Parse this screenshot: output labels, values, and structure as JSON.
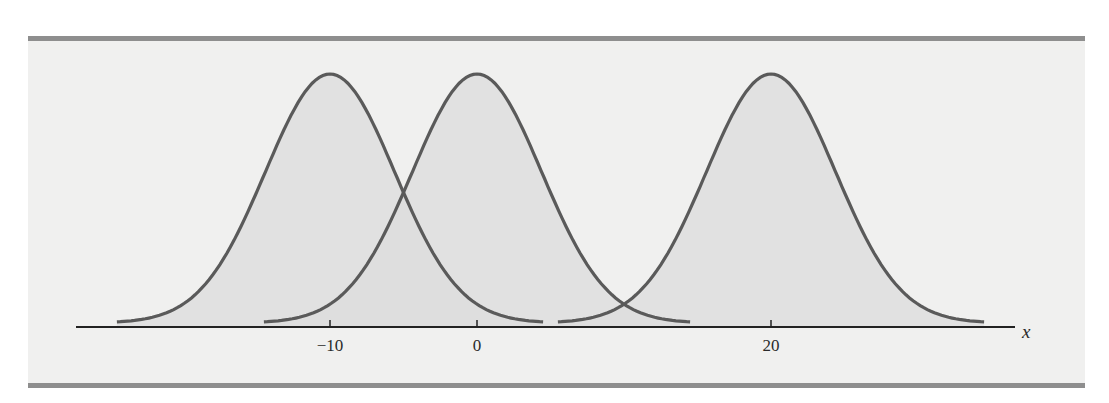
{
  "chart_data": {
    "type": "line",
    "title": "",
    "xlabel": "x",
    "ylabel": "",
    "x_ticks": [
      {
        "value": -10,
        "label": "−10"
      },
      {
        "value": 0,
        "label": "0"
      },
      {
        "value": 20,
        "label": "20"
      }
    ],
    "xlim": [
      -27.5,
      36.5
    ],
    "grid": false,
    "legend": null,
    "series": [
      {
        "name": "curve-mean-neg10",
        "mean": -10,
        "sigma": 4.4,
        "x_range": [
          -24.5,
          4.5
        ]
      },
      {
        "name": "curve-mean-0",
        "mean": 0,
        "sigma": 4.4,
        "x_range": [
          -14.5,
          14.5
        ]
      },
      {
        "name": "curve-mean-20",
        "mean": 20,
        "sigma": 4.4,
        "x_range": [
          5.5,
          34.5
        ]
      }
    ]
  },
  "figure": {
    "axis_label": "x",
    "colors": {
      "curve_stroke": "#5a5a5a",
      "curve_fill": "#dcdcdc",
      "panel_bg": "#f0f0ef",
      "rule": "#8e8e8e",
      "axis": "#222222"
    }
  }
}
